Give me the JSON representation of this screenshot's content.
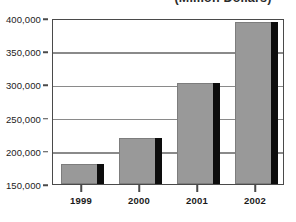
{
  "chart_data": {
    "type": "bar",
    "title": "(Million Dollars)",
    "title_note": "clipped at top edge of screenshot",
    "xlabel": "",
    "ylabel": "",
    "categories": [
      "1999",
      "2000",
      "2001",
      "2002"
    ],
    "values": [
      180000,
      220000,
      302000,
      394000
    ],
    "ylim": [
      150000,
      400000
    ],
    "yticks": [
      150000,
      200000,
      250000,
      300000,
      350000,
      400000
    ],
    "ytick_labels": [
      "150,000",
      "200,000",
      "250,000",
      "300,000",
      "350,000",
      "400,000"
    ],
    "grid": true,
    "grid_axis": "y",
    "legend": false,
    "series": [
      {
        "name": "",
        "values": [
          180000,
          220000,
          302000,
          394000
        ],
        "bar_color": "#999999",
        "shadow_color": "#0d0d0d"
      }
    ],
    "colors": {
      "bar_fill": "#999999",
      "bar_shadow": "#0d0d0d",
      "bar_border": "#7d7d7d",
      "gridline": "#8a8a8a",
      "frame": "#4a4a4a",
      "background": "#ffffff",
      "text": "#1a1a1a"
    }
  }
}
